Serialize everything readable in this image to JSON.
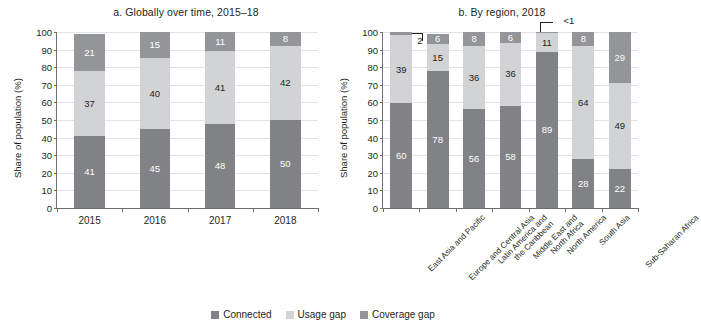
{
  "chart_data": [
    {
      "type": "bar",
      "title": "a. Globally over time, 2015–18",
      "xlabel": "",
      "ylabel": "Share of population (%)",
      "ylim": [
        0,
        100
      ],
      "yticks": [
        0,
        10,
        20,
        30,
        40,
        50,
        60,
        70,
        80,
        90,
        100
      ],
      "grid": true,
      "stacked": true,
      "legend_position": "bottom-center",
      "categories": [
        "2015",
        "2016",
        "2017",
        "2018"
      ],
      "series": [
        {
          "name": "Connected",
          "values": [
            41,
            45,
            48,
            50
          ]
        },
        {
          "name": "Usage gap",
          "values": [
            37,
            40,
            41,
            42
          ]
        },
        {
          "name": "Coverage gap",
          "values": [
            21,
            15,
            11,
            8
          ]
        }
      ],
      "labels": {
        "Connected": [
          "41",
          "45",
          "48",
          "50"
        ],
        "Usage gap": [
          "37",
          "40",
          "41",
          "42"
        ],
        "Coverage gap": [
          "21",
          "15",
          "11",
          "8"
        ]
      },
      "annotations": []
    },
    {
      "type": "bar",
      "title": "b. By region, 2018",
      "xlabel": "",
      "ylabel": "Share of population (%)",
      "ylim": [
        0,
        100
      ],
      "yticks": [
        0,
        10,
        20,
        30,
        40,
        50,
        60,
        70,
        80,
        90,
        100
      ],
      "grid": true,
      "stacked": true,
      "legend_position": "bottom-center",
      "categories": [
        "East Asia and Pacific",
        "Europe and Central Asia",
        "Latin America and\nthe Caribbean",
        "Middle East and\nNorth Africa",
        "North America",
        "South Asia",
        "Sub-Saharan Africa"
      ],
      "series": [
        {
          "name": "Connected",
          "values": [
            60,
            78,
            56,
            58,
            89,
            28,
            22
          ]
        },
        {
          "name": "Usage gap",
          "values": [
            39,
            15,
            36,
            36,
            11,
            64,
            49
          ]
        },
        {
          "name": "Coverage gap",
          "values": [
            2,
            6,
            8,
            6,
            0.5,
            8,
            29
          ]
        }
      ],
      "labels": {
        "Connected": [
          "60",
          "78",
          "56",
          "58",
          "89",
          "28",
          "22"
        ],
        "Usage gap": [
          "39",
          "15",
          "36",
          "36",
          "11",
          "64",
          "49"
        ],
        "Coverage gap": [
          "2",
          "6",
          "8",
          "6",
          "<1",
          "8",
          "29"
        ]
      },
      "annotations": [
        {
          "text": "2",
          "target": "East Asia and Pacific coverage gap"
        },
        {
          "text": "<1",
          "target": "North America coverage gap"
        }
      ]
    }
  ],
  "panel_a": {
    "title": "a. Globally over time, 2015–18",
    "ylabel": "Share of population (%)",
    "yticks": [
      "100",
      "90",
      "80",
      "70",
      "60",
      "50",
      "40",
      "30",
      "20",
      "10",
      "0"
    ],
    "bars": [
      {
        "label": "2015",
        "connected": "41",
        "usage": "37",
        "coverage": "21"
      },
      {
        "label": "2016",
        "connected": "45",
        "usage": "40",
        "coverage": "15"
      },
      {
        "label": "2017",
        "connected": "48",
        "usage": "41",
        "coverage": "11"
      },
      {
        "label": "2018",
        "connected": "50",
        "usage": "42",
        "coverage": "8"
      }
    ]
  },
  "panel_b": {
    "title": "b. By region, 2018",
    "ylabel": "Share of population (%)",
    "yticks": [
      "100",
      "90",
      "80",
      "70",
      "60",
      "50",
      "40",
      "30",
      "20",
      "10",
      "0"
    ],
    "callout_2": "2",
    "callout_lt1": "<1",
    "bars": [
      {
        "label_line1": "East Asia and Pacific",
        "label_line2": "",
        "connected": "60",
        "usage": "39",
        "coverage": ""
      },
      {
        "label_line1": "Europe and Central Asia",
        "label_line2": "",
        "connected": "78",
        "usage": "15",
        "coverage": "6"
      },
      {
        "label_line1": "Latin America and",
        "label_line2": "the Caribbean",
        "connected": "56",
        "usage": "36",
        "coverage": "8"
      },
      {
        "label_line1": "Middle East and",
        "label_line2": "North Africa",
        "connected": "58",
        "usage": "36",
        "coverage": "6"
      },
      {
        "label_line1": "North America",
        "label_line2": "",
        "connected": "89",
        "usage": "11",
        "coverage": ""
      },
      {
        "label_line1": "South Asia",
        "label_line2": "",
        "connected": "28",
        "usage": "64",
        "coverage": "8"
      },
      {
        "label_line1": "Sub-Saharan Africa",
        "label_line2": "",
        "connected": "22",
        "usage": "49",
        "coverage": "29"
      }
    ]
  },
  "legend": {
    "items": [
      {
        "label": "Connected",
        "color": "#808285"
      },
      {
        "label": "Usage gap",
        "color": "#d1d3d4"
      },
      {
        "label": "Coverage gap",
        "color": "#939598"
      }
    ]
  }
}
